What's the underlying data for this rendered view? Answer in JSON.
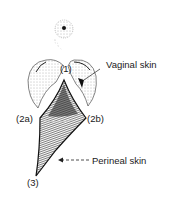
{
  "diagram": {
    "labels": {
      "point_1": "(1)",
      "point_2a": "(2a)",
      "point_2b": "(2b)",
      "point_3": "(3)",
      "vaginal_skin": "Vaginal skin",
      "perineal_skin": "Perineal skin"
    },
    "colors": {
      "ink": "#1a1a1a",
      "stipple": "#555555",
      "background": "#ffffff"
    }
  }
}
